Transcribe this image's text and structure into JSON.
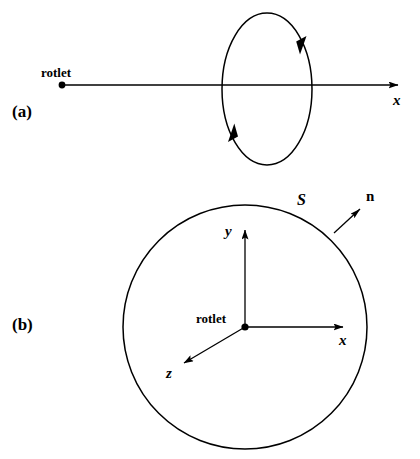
{
  "figure": {
    "background_color": "#ffffff",
    "stroke_color": "#000000",
    "width": 420,
    "height": 459
  },
  "panels": [
    {
      "tag": "(a)",
      "view": "side view along the x-axis",
      "labels": {
        "singularity": "rotlet",
        "axis_x": "x"
      },
      "geometry": {
        "rotlet_point": {
          "x": 62,
          "y": 85
        },
        "axis_line": {
          "x1": 62,
          "y1": 85,
          "x2": 400,
          "y2": 85
        },
        "circulation_ellipse": {
          "cx": 267,
          "cy": 89,
          "rx": 45,
          "ry": 76
        },
        "arrowheads": [
          {
            "name": "circulation-arrow-right",
            "x": 302,
            "y": 48,
            "direction": "down"
          },
          {
            "name": "circulation-arrow-left",
            "x": 232,
            "y": 130,
            "direction": "up"
          }
        ]
      }
    },
    {
      "tag": "(b)",
      "view": "cross-section normal to the x-axis",
      "labels": {
        "singularity": "rotlet",
        "axis_x": "x",
        "axis_y": "y",
        "axis_z": "z",
        "surface": "S",
        "normal": "n"
      },
      "geometry": {
        "origin": {
          "x": 245,
          "y": 327
        },
        "circle": {
          "cx": 245,
          "cy": 327,
          "r": 122
        },
        "axes": [
          {
            "name": "x",
            "x1": 245,
            "y1": 327,
            "x2": 345,
            "y2": 327
          },
          {
            "name": "y",
            "x1": 245,
            "y1": 327,
            "x2": 245,
            "y2": 228
          },
          {
            "name": "z",
            "x1": 245,
            "y1": 327,
            "x2": 182,
            "y2": 365
          }
        ],
        "normal_vector": {
          "x1": 334,
          "y1": 233,
          "x2": 362,
          "y2": 207
        }
      }
    }
  ]
}
